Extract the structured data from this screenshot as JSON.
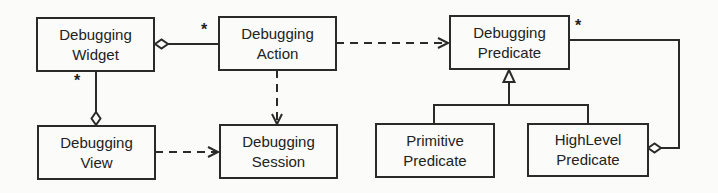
{
  "diagram": {
    "type": "uml-class-diagram",
    "classes": [
      {
        "id": "widget",
        "line1": "Debugging",
        "line2": "Widget"
      },
      {
        "id": "action",
        "line1": "Debugging",
        "line2": "Action"
      },
      {
        "id": "predicate",
        "line1": "Debugging",
        "line2": "Predicate"
      },
      {
        "id": "view",
        "line1": "Debugging",
        "line2": "View"
      },
      {
        "id": "session",
        "line1": "Debugging",
        "line2": "Session"
      },
      {
        "id": "primitive",
        "line1": "Primitive",
        "line2": "Predicate"
      },
      {
        "id": "highlevel",
        "line1": "HighLevel",
        "line2": "Predicate"
      }
    ],
    "relations": [
      {
        "from": "widget",
        "to": "action",
        "kind": "aggregation",
        "multiplicity": "*"
      },
      {
        "from": "widget",
        "to": "view",
        "kind": "aggregation",
        "multiplicity": "*"
      },
      {
        "from": "action",
        "to": "predicate",
        "kind": "dependency"
      },
      {
        "from": "action",
        "to": "session",
        "kind": "dependency"
      },
      {
        "from": "view",
        "to": "session",
        "kind": "dependency"
      },
      {
        "from": "primitive",
        "to": "predicate",
        "kind": "generalization"
      },
      {
        "from": "highlevel",
        "to": "predicate",
        "kind": "generalization"
      },
      {
        "from": "highlevel",
        "to": "predicate",
        "kind": "aggregation",
        "multiplicity": "*"
      }
    ],
    "multiplicity_labels": {
      "widget_action": "*",
      "widget_view": "*",
      "highlevel_predicate": "*"
    }
  }
}
